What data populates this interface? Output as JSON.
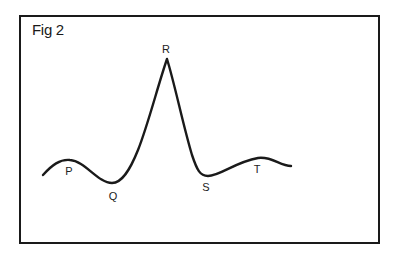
{
  "figure": {
    "title": "Fig 2",
    "stroke_color": "#1a1a1a",
    "labels": {
      "P": "P",
      "Q": "Q",
      "R": "R",
      "S": "S",
      "T": "T"
    }
  }
}
